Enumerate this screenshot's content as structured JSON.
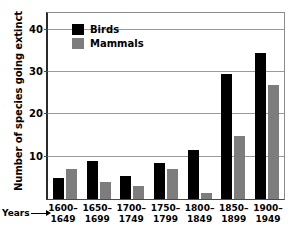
{
  "chart_data": {
    "type": "bar",
    "title": "",
    "xlabel": "Years",
    "ylabel": "Number of species going extinct",
    "categories": [
      "1600–\n1649",
      "1650–\n1699",
      "1700–\n1749",
      "1750–\n1799",
      "1800–\n1849",
      "1850–\n1899",
      "1900–\n1949"
    ],
    "series": [
      {
        "name": "Birds",
        "color": "#000000",
        "values": [
          5,
          9,
          5.5,
          8.5,
          11.5,
          29.5,
          34.5
        ]
      },
      {
        "name": "Mammals",
        "color": "#7d7d7d",
        "values": [
          7,
          4,
          3,
          7,
          1.5,
          15,
          27
        ]
      }
    ],
    "ylim": [
      0,
      44
    ],
    "yticks": [
      10,
      20,
      30,
      40
    ],
    "ytick_labels": [
      "10",
      "20",
      "30",
      "40"
    ],
    "grid": true,
    "legend_position": "top-left"
  },
  "axes": {
    "y_title": "Number of species going extinct",
    "x_title": "Years"
  },
  "legend": {
    "items": [
      {
        "label": "Birds"
      },
      {
        "label": "Mammals"
      }
    ]
  },
  "colors": {
    "birds": "#000000",
    "mammals": "#7d7d7d",
    "gridline": "#9a9a9a",
    "axis": "#2b2b2b",
    "background": "#ffffff"
  }
}
